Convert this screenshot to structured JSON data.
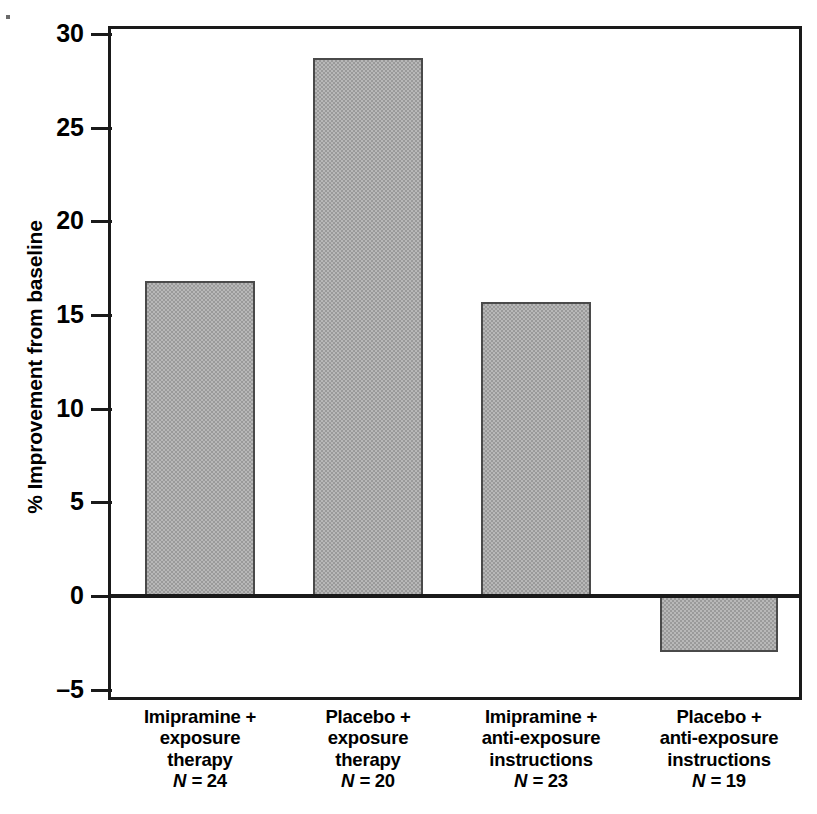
{
  "figure": {
    "background_color": "#ffffff",
    "frame_color": "#1a1a1a",
    "bar_fill_color": "#9a9a9a",
    "bar_edge_color": "#4a4a4a"
  },
  "chart_data": {
    "type": "bar",
    "title": "",
    "xlabel": "",
    "ylabel": "% Improvement from baseline",
    "ylim": [
      -5,
      30
    ],
    "yticks": [
      -5,
      0,
      5,
      10,
      15,
      20,
      25,
      30
    ],
    "ytick_labels": [
      "–5",
      "0",
      "5",
      "10",
      "15",
      "20",
      "25",
      "30"
    ],
    "grid": false,
    "legend": "none",
    "zero_line": true,
    "categories": [
      "Imipramine + exposure therapy",
      "Placebo + exposure therapy",
      "Imipramine + anti-exposure instructions",
      "Placebo + anti-exposure instructions"
    ],
    "category_lines": [
      [
        "Imipramine +",
        "exposure",
        "therapy"
      ],
      [
        "Placebo +",
        "exposure",
        "therapy"
      ],
      [
        "Imipramine +",
        "anti-exposure",
        "instructions"
      ],
      [
        "Placebo +",
        "anti-exposure",
        "instructions"
      ]
    ],
    "group_sizes": [
      24,
      20,
      23,
      19
    ],
    "group_size_labels": [
      "N = 24",
      "N = 20",
      "N = 23",
      "N = 19"
    ],
    "n_symbol": "N",
    "n_equals": " = ",
    "values": [
      16.8,
      28.7,
      15.7,
      -3.0
    ]
  },
  "categories": [
    {
      "line1": "Imipramine +",
      "line2": "exposure",
      "line3": "therapy",
      "n_value": "24"
    },
    {
      "line1": "Placebo +",
      "line2": "exposure",
      "line3": "therapy",
      "n_value": "20"
    },
    {
      "line1": "Imipramine +",
      "line2": "anti-exposure",
      "line3": "instructions",
      "n_value": "23"
    },
    {
      "line1": "Placebo +",
      "line2": "anti-exposure",
      "line3": "instructions",
      "n_value": "19"
    }
  ],
  "axis": {
    "y_title": "% Improvement from baseline",
    "ticks": [
      {
        "label": "30"
      },
      {
        "label": "25"
      },
      {
        "label": "20"
      },
      {
        "label": "15"
      },
      {
        "label": "10"
      },
      {
        "label": "5"
      },
      {
        "label": "0"
      },
      {
        "label": "–5"
      }
    ]
  },
  "n_prefix": "N",
  "n_sep": " = "
}
